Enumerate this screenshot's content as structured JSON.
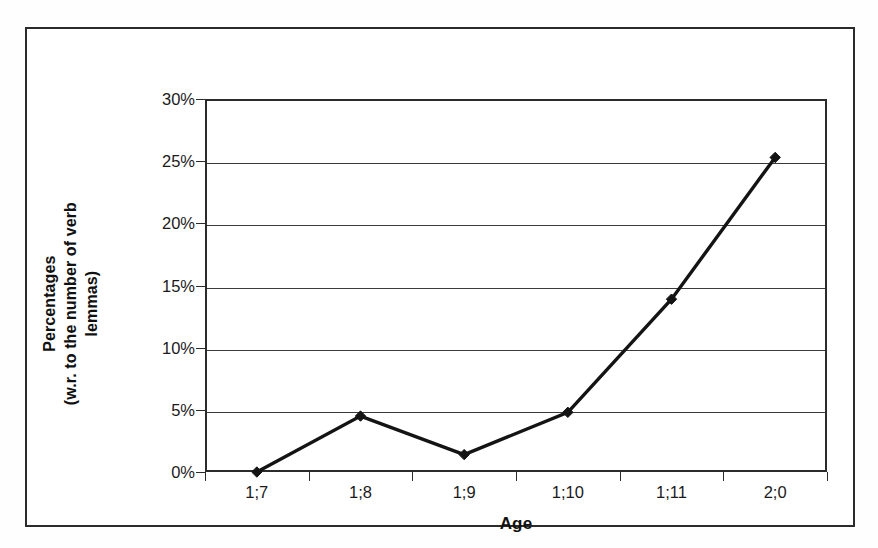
{
  "figure": {
    "cropped_caption_fragment": "percentages of verbal morphology",
    "background_color": "#ffffff",
    "frame_color": "#2b2b2b"
  },
  "chart_data": {
    "type": "line",
    "title": "",
    "subtitle": "",
    "xlabel": "Age",
    "ylabel": "Percentages (w.r. to the number of verb lemmas)",
    "ylabel_line1": "Percentages",
    "ylabel_line2": "(w.r. to the number of verb lemmas)",
    "categories": [
      "1;7",
      "1;8",
      "1;9",
      "1;10",
      "1;11",
      "2;0"
    ],
    "values": [
      0.0,
      4.5,
      1.4,
      4.8,
      13.9,
      25.3
    ],
    "series": [
      {
        "name": "Percentages",
        "values": [
          0.0,
          4.5,
          1.4,
          4.8,
          13.9,
          25.3
        ],
        "color": "#141414",
        "marker": "diamond",
        "line_width": 3
      }
    ],
    "ylim": [
      0,
      30
    ],
    "ytick_values": [
      0,
      5,
      10,
      15,
      20,
      25,
      30
    ],
    "ytick_labels": [
      "0%",
      "5%",
      "10%",
      "15%",
      "20%",
      "25%",
      "30%"
    ],
    "xtick_labels": [
      "1;7",
      "1;8",
      "1;9",
      "1;10",
      "1;11",
      "2;0"
    ],
    "grid": "horizontal",
    "grid_color": "#3a3a3a",
    "legend": "none",
    "legend_position": "none",
    "annotations": []
  }
}
